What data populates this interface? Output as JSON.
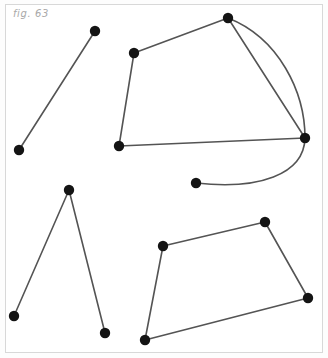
{
  "figure": {
    "caption": "fig. 63",
    "background_color": "#ffffff",
    "panel_color": "#fdfdfd",
    "frame_color": "#d8d8d8",
    "edge_color": "#545454",
    "vertex_color": "#141414",
    "edge_width": 1.6,
    "vertex_radius": 5.2,
    "width": 328,
    "height": 358
  },
  "chart_data": {
    "type": "scatter",
    "title": "fig. 63",
    "xlabel": "",
    "ylabel": "",
    "xlim": [
      0,
      328
    ],
    "ylim": [
      358,
      0
    ],
    "grid": false,
    "legend": "none",
    "vertices": [
      {
        "id": "v1",
        "x": 95,
        "y": 31,
        "group": "open-segment"
      },
      {
        "id": "v2",
        "x": 19,
        "y": 150,
        "group": "open-segment"
      },
      {
        "id": "v3",
        "x": 134,
        "y": 53,
        "group": "upper-arc-figure"
      },
      {
        "id": "v4",
        "x": 228,
        "y": 18,
        "group": "upper-arc-figure"
      },
      {
        "id": "v5",
        "x": 305,
        "y": 138,
        "group": "upper-arc-figure"
      },
      {
        "id": "v6",
        "x": 119,
        "y": 146,
        "group": "upper-arc-figure"
      },
      {
        "id": "v7",
        "x": 196,
        "y": 183,
        "group": "upper-arc-figure"
      },
      {
        "id": "v8",
        "x": 69,
        "y": 190,
        "group": "lambda-figure"
      },
      {
        "id": "v9",
        "x": 14,
        "y": 316,
        "group": "lambda-figure"
      },
      {
        "id": "v10",
        "x": 105,
        "y": 333,
        "group": "lambda-figure"
      },
      {
        "id": "v11",
        "x": 163,
        "y": 246,
        "group": "quadrilateral"
      },
      {
        "id": "v12",
        "x": 265,
        "y": 222,
        "group": "quadrilateral"
      },
      {
        "id": "v13",
        "x": 308,
        "y": 298,
        "group": "quadrilateral"
      },
      {
        "id": "v14",
        "x": 145,
        "y": 340,
        "group": "quadrilateral"
      }
    ],
    "edges": [
      {
        "id": "e1",
        "from": "v1",
        "to": "v2",
        "shape": "line"
      },
      {
        "id": "e2",
        "from": "v3",
        "to": "v4",
        "shape": "line"
      },
      {
        "id": "e3",
        "from": "v4",
        "to": "v5",
        "shape": "line"
      },
      {
        "id": "e4",
        "from": "v3",
        "to": "v6",
        "shape": "line"
      },
      {
        "id": "e5",
        "from": "v6",
        "to": "v5",
        "shape": "line"
      },
      {
        "id": "e6",
        "from": "v4",
        "to": "v5",
        "shape": "arc",
        "bulge": "right"
      },
      {
        "id": "e7",
        "from": "v5",
        "to": "v7",
        "shape": "arc",
        "bulge": "down"
      },
      {
        "id": "e8",
        "from": "v8",
        "to": "v9",
        "shape": "line"
      },
      {
        "id": "e9",
        "from": "v8",
        "to": "v10",
        "shape": "line"
      },
      {
        "id": "e10",
        "from": "v11",
        "to": "v12",
        "shape": "line"
      },
      {
        "id": "e11",
        "from": "v12",
        "to": "v13",
        "shape": "line"
      },
      {
        "id": "e12",
        "from": "v13",
        "to": "v14",
        "shape": "line"
      },
      {
        "id": "e13",
        "from": "v14",
        "to": "v11",
        "shape": "line"
      }
    ],
    "paths": {
      "e6": "M 228 18 C 279 38 305 92 305 138",
      "e7": "M 305 138 C 304 175 258 190 196 183"
    }
  }
}
